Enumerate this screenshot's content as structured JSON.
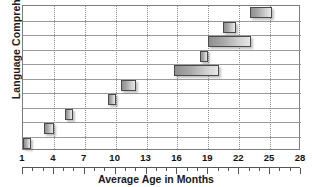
{
  "chart_data": {
    "type": "bar",
    "orientation": "horizontal",
    "bar_style": "floating-range",
    "title": "",
    "xlabel": "Average Age in Months",
    "ylabel": "Language Comprehension",
    "xlim": [
      1,
      28
    ],
    "xticks": [
      1,
      4,
      7,
      10,
      13,
      16,
      19,
      22,
      25,
      28
    ],
    "xticklabels": [
      "1",
      "4",
      "7",
      "10",
      "13",
      "16",
      "19",
      "22",
      "25",
      "28"
    ],
    "minor_tick_interval": 1,
    "grid": "vertical dotted at major ticks; horizontal solid row separators",
    "legend": "none",
    "categories": [
      "row-1",
      "row-2",
      "row-3",
      "row-4",
      "row-5",
      "row-6",
      "row-7",
      "row-8",
      "row-9",
      "row-10"
    ],
    "bars": [
      {
        "row": 10,
        "start": 23.0,
        "end": 25.2
      },
      {
        "row": 9,
        "start": 20.4,
        "end": 21.7
      },
      {
        "row": 8,
        "start": 19.0,
        "end": 23.1
      },
      {
        "row": 7,
        "start": 18.2,
        "end": 19.0
      },
      {
        "row": 6,
        "start": 15.7,
        "end": 20.0
      },
      {
        "row": 5,
        "start": 10.5,
        "end": 12.0
      },
      {
        "row": 4,
        "start": 9.3,
        "end": 10.0
      },
      {
        "row": 3,
        "start": 5.1,
        "end": 5.9
      },
      {
        "row": 2,
        "start": 3.0,
        "end": 4.0
      },
      {
        "row": 1,
        "start": 1.0,
        "end": 1.8
      }
    ],
    "colors": {
      "bar_fill_dark": "#8f8f8f",
      "bar_fill_light": "#e8e8e8",
      "bar_border": "#4a4a4a",
      "frame": "#7d7d7d",
      "rowline": "#9a9a9a",
      "gridline": "#8e8e8e",
      "text": "#111111",
      "background": "#ffffff"
    }
  }
}
